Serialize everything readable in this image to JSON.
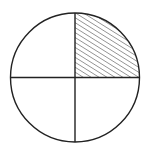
{
  "diagram": {
    "type": "fraction-circle",
    "parts_total": 4,
    "parts_shaded": 1,
    "shaded_quadrant": "top-right",
    "fraction": "1/4",
    "shading_style": "diagonal-hatch",
    "colors": {
      "background": "#ffffff",
      "stroke": "#222222",
      "hatch": "#333333"
    }
  }
}
